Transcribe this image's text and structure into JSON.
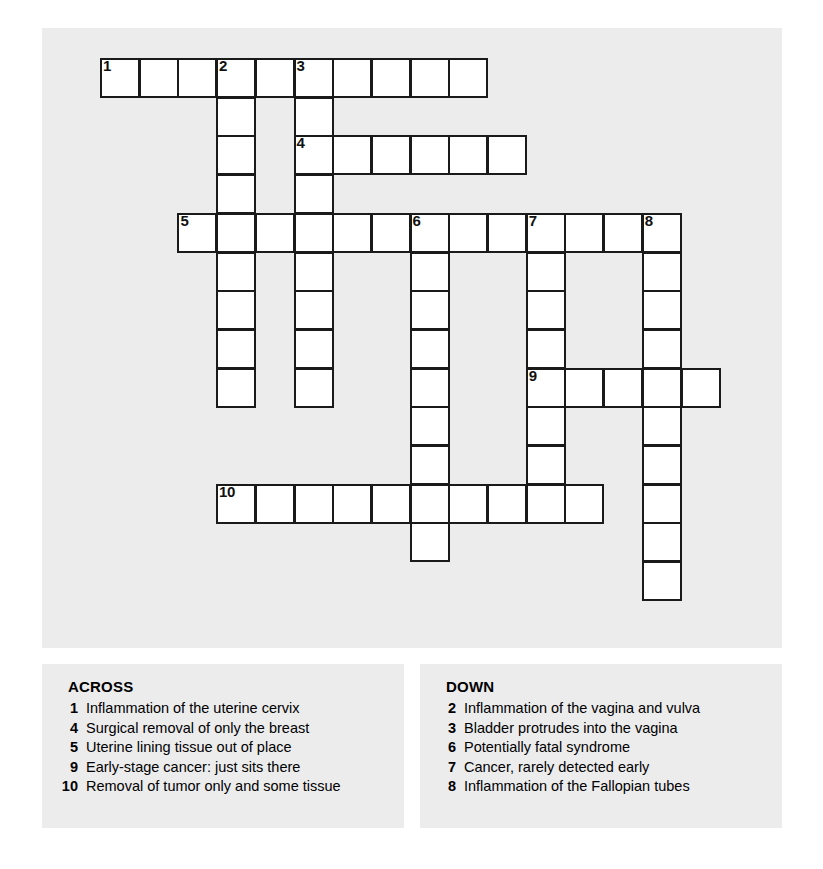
{
  "puzzle": {
    "cell_size": 38.7,
    "origin_x": 58,
    "origin_y": 30,
    "entries": [
      {
        "number": "1",
        "direction": "across",
        "row": 0,
        "col": 0,
        "length": 10
      },
      {
        "number": "2",
        "direction": "down",
        "row": 0,
        "col": 3,
        "length": 9
      },
      {
        "number": "3",
        "direction": "down",
        "row": 0,
        "col": 5,
        "length": 9
      },
      {
        "number": "4",
        "direction": "across",
        "row": 2,
        "col": 5,
        "length": 6
      },
      {
        "number": "5",
        "direction": "across",
        "row": 4,
        "col": 2,
        "length": 13
      },
      {
        "number": "6",
        "direction": "down",
        "row": 4,
        "col": 8,
        "length": 9
      },
      {
        "number": "7",
        "direction": "down",
        "row": 4,
        "col": 11,
        "length": 7
      },
      {
        "number": "8",
        "direction": "down",
        "row": 4,
        "col": 14,
        "length": 10
      },
      {
        "number": "9",
        "direction": "across",
        "row": 8,
        "col": 11,
        "length": 5
      },
      {
        "number": "10",
        "direction": "across",
        "row": 11,
        "col": 3,
        "length": 10
      }
    ]
  },
  "clues": {
    "across": {
      "heading": "ACROSS",
      "items": [
        {
          "number": "1",
          "text": "Inflammation of the uterine cervix"
        },
        {
          "number": "4",
          "text": "Surgical removal of only the breast"
        },
        {
          "number": "5",
          "text": "Uterine lining tissue out of place"
        },
        {
          "number": "9",
          "text": "Early-stage cancer: just sits there"
        },
        {
          "number": "10",
          "text": "Removal of tumor only and some tissue"
        }
      ]
    },
    "down": {
      "heading": "DOWN",
      "items": [
        {
          "number": "2",
          "text": "Inflammation of the vagina and vulva"
        },
        {
          "number": "3",
          "text": "Bladder protrudes into the vagina"
        },
        {
          "number": "6",
          "text": "Potentially fatal syndrome"
        },
        {
          "number": "7",
          "text": "Cancer, rarely detected early"
        },
        {
          "number": "8",
          "text": "Inflammation of the Fallopian tubes"
        }
      ]
    }
  },
  "colors": {
    "panel_background": "#ececed",
    "cell_fill": "#ffffff",
    "cell_border": "#1a1a1a",
    "text": "#000000"
  }
}
